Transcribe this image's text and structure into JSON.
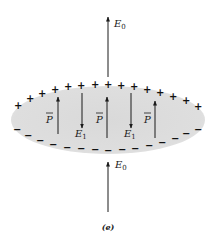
{
  "figure": {
    "caption": "(e)",
    "colors": {
      "background": "#ffffff",
      "dielectric_fill": "#dcdcdc",
      "ink": "#1a1a1a"
    },
    "external_field": {
      "top_label": "E",
      "top_sub": "0",
      "bottom_label": "E",
      "bottom_sub": "0"
    },
    "polarization": {
      "label": "P",
      "count": 3,
      "direction": "up"
    },
    "depolarizing_field": {
      "label": "E",
      "sub": "1",
      "count": 2,
      "direction": "down"
    },
    "surface_charges": {
      "top": "+",
      "bottom": "−"
    }
  }
}
